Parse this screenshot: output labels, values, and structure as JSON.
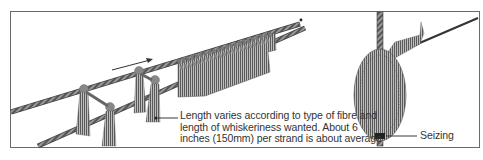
{
  "figure": {
    "left_panel": {
      "description": "Two parallel rope strands with tufts of fibre hitched on, pushed along to form a whisker fringe",
      "arrow_direction": "right",
      "caption_lines": [
        "Length varies according to type of fibre and",
        "length of whiskeriness wanted. About 6",
        "inches (150mm) per strand is about average"
      ]
    },
    "right_panel": {
      "description": "Completed fringe wound spirally around a vertical rope forming a bushy cylinder",
      "label": "Seizing"
    }
  },
  "colors": {
    "frame": "#6a6a6a",
    "rope": "#555555",
    "fibre": "#6b6b6b",
    "text": "#333333"
  }
}
